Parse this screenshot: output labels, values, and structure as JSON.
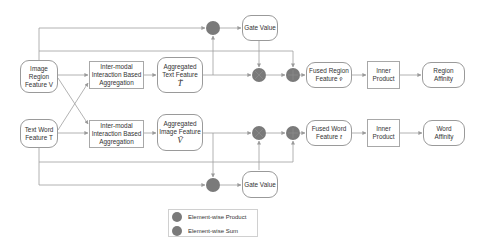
{
  "diagram": {
    "nodes": {
      "image_region": {
        "line1": "Image",
        "line2": "Region",
        "line3": "Feature V"
      },
      "text_word": {
        "line1": "Text Word",
        "line2": "Feature T"
      },
      "inter_modal_top": {
        "line1": "Inter-modal",
        "line2": "Interaction Based",
        "line3": "Aggregation"
      },
      "inter_modal_bottom": {
        "line1": "Inter-modal",
        "line2": "Interaction Based",
        "line3": "Aggregation"
      },
      "aggregated_text": {
        "line1": "Aggregated",
        "line2": "Text Feature",
        "symbol": "T̃"
      },
      "aggregated_image": {
        "line1": "Aggregated",
        "line2": "Image Feature",
        "symbol": "Ṽ"
      },
      "gate_value_top": {
        "label": "Gate Value"
      },
      "gate_value_bottom": {
        "label": "Gate Value"
      },
      "fused_region": {
        "line1": "Fused Region",
        "line2": "Feature",
        "symbol": "v̂"
      },
      "fused_word": {
        "line1": "Fused Word",
        "line2": "Feature",
        "symbol": "t̂"
      },
      "inner_product_top": {
        "line1": "Inner",
        "line2": "Product"
      },
      "inner_product_bottom": {
        "line1": "Inner",
        "line2": "Product"
      },
      "region_affinity": {
        "line1": "Region",
        "line2": "Affinity"
      },
      "word_affinity": {
        "line1": "Word",
        "line2": "Affinity"
      }
    },
    "operators": [
      {
        "id": "top-gate-product",
        "type": "element-wise-product",
        "x": 213,
        "y": 28
      },
      {
        "id": "top-mix-product",
        "type": "element-wise-product",
        "x": 259,
        "y": 75
      },
      {
        "id": "top-sum",
        "type": "element-wise-sum",
        "x": 293,
        "y": 75
      },
      {
        "id": "bottom-mix-product",
        "type": "element-wise-product",
        "x": 259,
        "y": 133
      },
      {
        "id": "bottom-sum",
        "type": "element-wise-sum",
        "x": 293,
        "y": 133
      },
      {
        "id": "bottom-gate-product",
        "type": "element-wise-product",
        "x": 213,
        "y": 185
      }
    ],
    "colors": {
      "operator_fill": "#7a7a7a",
      "line": "#9a9a9a",
      "box_border": "#9a9a9a"
    }
  },
  "legend": {
    "items": [
      {
        "label": "Element-wise Product"
      },
      {
        "label": "Element-wise Sum"
      }
    ]
  }
}
